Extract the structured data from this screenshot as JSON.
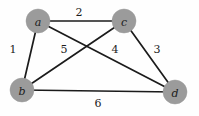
{
  "figure": {
    "kind": "weighted-undirected-graph",
    "background_color": "#fefefe",
    "node_fill_color": "#9b9b9b",
    "edge_color": "#1b1b1b",
    "label_color": "#1c1c1c"
  },
  "nodes": [
    {
      "id": "a",
      "label": "a",
      "cx": 38,
      "cy": 21,
      "r": 12
    },
    {
      "id": "c",
      "label": "c",
      "cx": 124,
      "cy": 21,
      "r": 12
    },
    {
      "id": "b",
      "label": "b",
      "cx": 22,
      "cy": 90,
      "r": 12
    },
    {
      "id": "d",
      "label": "d",
      "cx": 175,
      "cy": 92,
      "r": 12
    }
  ],
  "edges": [
    {
      "id": "a-c",
      "from": "a",
      "to": "c",
      "weight": "2",
      "label_x": 79,
      "label_y": 12
    },
    {
      "id": "a-b",
      "from": "a",
      "to": "b",
      "weight": "1",
      "label_x": 13,
      "label_y": 49
    },
    {
      "id": "b-c",
      "from": "b",
      "to": "c",
      "weight": "5",
      "label_x": 64,
      "label_y": 49
    },
    {
      "id": "a-d",
      "from": "a",
      "to": "d",
      "weight": "4",
      "label_x": 115,
      "label_y": 49
    },
    {
      "id": "c-d",
      "from": "c",
      "to": "d",
      "weight": "3",
      "label_x": 157,
      "label_y": 49
    },
    {
      "id": "b-d",
      "from": "b",
      "to": "d",
      "weight": "6",
      "label_x": 98,
      "label_y": 103
    }
  ]
}
